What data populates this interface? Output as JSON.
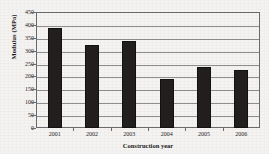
{
  "chart_data": {
    "type": "bar",
    "title": "",
    "xlabel": "Construction year",
    "ylabel": "Modulus (MPa)",
    "categories": [
      "2001",
      "2002",
      "2003",
      "2004",
      "2005",
      "2006"
    ],
    "values": [
      388,
      322,
      337,
      190,
      238,
      225
    ],
    "series": [
      {
        "name": "Modulus",
        "values": [
          388,
          322,
          337,
          190,
          238,
          225
        ]
      }
    ],
    "ylim": [
      0,
      450
    ],
    "ytick_values": [
      0,
      50,
      100,
      150,
      200,
      250,
      300,
      350,
      400,
      450
    ],
    "ytick_labels": [
      "0",
      "50",
      "100",
      "150",
      "200",
      "250",
      "300",
      "350",
      "400",
      "450"
    ],
    "grid": "horizontal",
    "legend": "none",
    "bar_color": "#231f1f",
    "grid_color": "#8e8e8e",
    "frame_color": "#6b6b6b",
    "background_color": "#f4f3f1"
  }
}
